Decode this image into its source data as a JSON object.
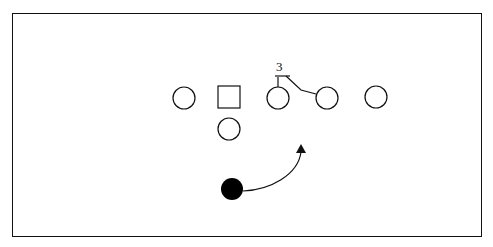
{
  "diagram": {
    "type": "football-play-diagram",
    "border": true,
    "stroke_color": "#111111",
    "fill_color": "#000000",
    "players": [
      {
        "shape": "circle",
        "role": "offensive-player",
        "x": 184,
        "y": 98,
        "r": 11
      },
      {
        "shape": "square",
        "role": "center",
        "x": 229,
        "y": 97,
        "size": 22
      },
      {
        "shape": "circle",
        "role": "offensive-player",
        "x": 278,
        "y": 98,
        "r": 11
      },
      {
        "shape": "circle",
        "role": "offensive-player",
        "x": 327,
        "y": 98,
        "r": 11
      },
      {
        "shape": "circle",
        "role": "offensive-player",
        "x": 376,
        "y": 97,
        "r": 11
      },
      {
        "shape": "circle",
        "role": "quarterback",
        "x": 229,
        "y": 129,
        "r": 11
      },
      {
        "shape": "filled-circle",
        "role": "ball-carrier",
        "x": 232,
        "y": 190,
        "r": 11
      }
    ],
    "annotations": [
      {
        "text": "3",
        "x": 280,
        "y": 70
      }
    ],
    "routes": [
      {
        "kind": "block-line",
        "from": "player-3",
        "to": "player-4"
      },
      {
        "kind": "arrow-path",
        "from": "ball-carrier",
        "direction": "up-right"
      }
    ]
  }
}
